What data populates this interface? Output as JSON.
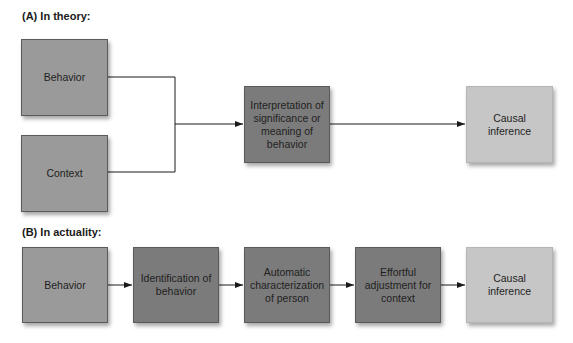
{
  "panel_a": {
    "label": "(A) In theory:",
    "boxes": {
      "behavior": "Behavior",
      "context": "Context",
      "interpretation": "Interpretation of significance or meaning of behavior",
      "causal": "Causal inference"
    }
  },
  "panel_b": {
    "label": "(B) In actuality:",
    "boxes": {
      "behavior": "Behavior",
      "identification": "Identification of behavior",
      "automatic": "Automatic characterization of person",
      "effortful": "Effortful adjustment for context",
      "causal": "Causal inference"
    }
  },
  "colors": {
    "input_box": "#9a9a9a",
    "process_box": "#7b7b7b",
    "output_box": "#c6c6c6",
    "line": "#1a1a1a"
  }
}
